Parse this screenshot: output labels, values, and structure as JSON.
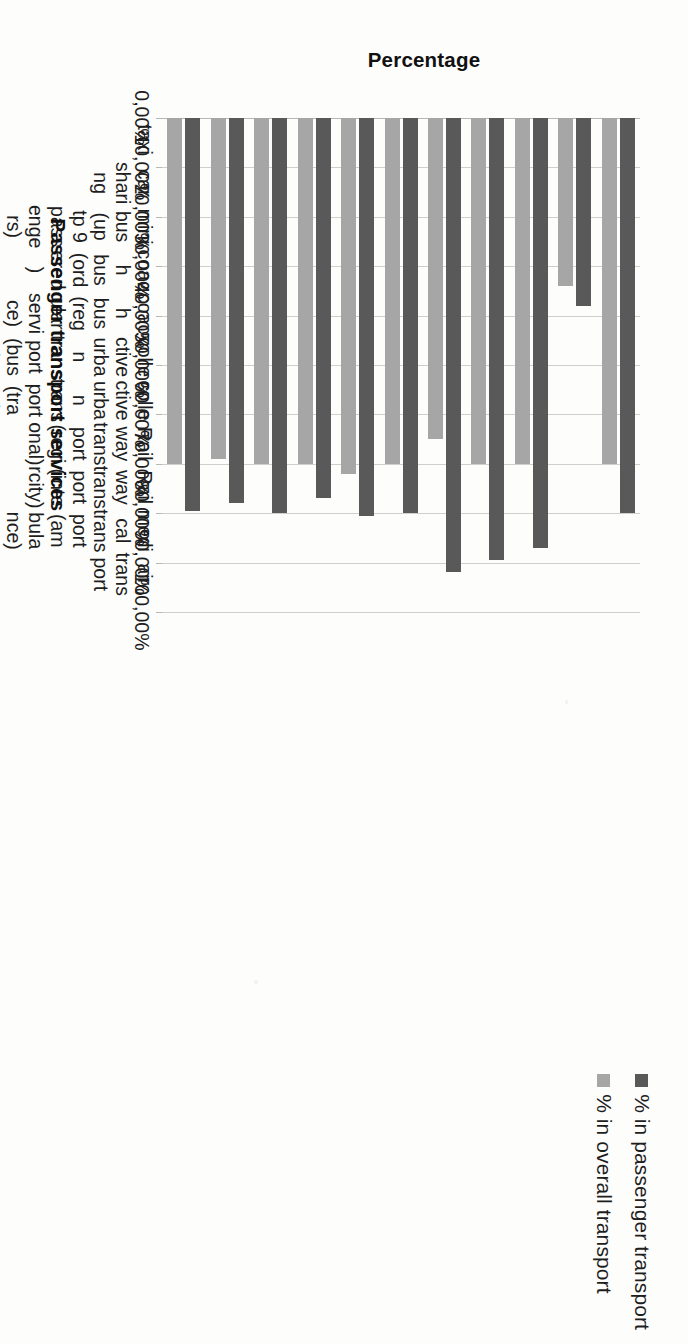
{
  "chart_data": {
    "type": "bar",
    "orientation": "horizontal",
    "title": "",
    "xlabel": "Passenger transport services",
    "ylabel": "Percentage",
    "ylim": [
      0,
      100
    ],
    "ytick_step": 10,
    "grid": true,
    "legend_position": "bottom-right",
    "value_suffix": "%",
    "decimal_separator": ",",
    "categories": [
      "taxi",
      "car sharing",
      "mini bus (up tp 9 passengers)",
      "coach bus (ordered)",
      "coach bus (regular service)",
      "collective urban transport (bus)",
      "collective urban transport (tram)",
      "Railway transport (regional)",
      "Railway transport (intercity)",
      "medical transport (ambulance)",
      "air transport"
    ],
    "tick_labels": [
      "0,00%",
      "10,00%",
      "20,00%",
      "30,00%",
      "40,00%",
      "50,00%",
      "60,00%",
      "70,00%",
      "80,00%",
      "90,00%",
      "100,00%"
    ],
    "series": [
      {
        "name": "% in passenger transport",
        "color": "#595959",
        "values": [
          80.0,
          38.0,
          87.0,
          89.5,
          92.0,
          80.0,
          80.5,
          77.0,
          80.0,
          78.0,
          79.5
        ]
      },
      {
        "name": "% in overall transport",
        "color": "#a6a6a6",
        "values": [
          70.0,
          34.0,
          70.0,
          70.0,
          65.0,
          70.0,
          72.0,
          70.0,
          70.0,
          69.0,
          70.0
        ]
      }
    ]
  },
  "legend": {
    "items": [
      {
        "label": "% in passenger transport",
        "color": "#595959"
      },
      {
        "label": "% in overall transport",
        "color": "#a6a6a6"
      }
    ]
  },
  "axes": {
    "value_axis_title": "Percentage",
    "category_axis_title": "Passenger transport services"
  }
}
